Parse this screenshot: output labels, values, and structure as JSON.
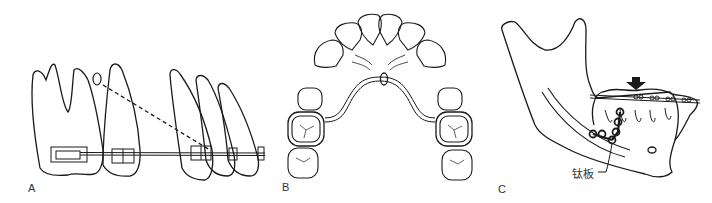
{
  "figure": {
    "panels": [
      {
        "id": "A",
        "label": "A",
        "description": "Lateral view of teeth with brackets, archwire and dashed ligature to a mini-implant/anchor"
      },
      {
        "id": "B",
        "label": "B",
        "description": "Occlusal view of maxillary arch with transpalatal arch connecting molar bands and central loop"
      },
      {
        "id": "C",
        "label": "C",
        "description": "Mandible lateral view with fixed appliance, intrusion arrow and titanium miniplate",
        "annotations": [
          {
            "text": "钛板",
            "meaning": "titanium plate"
          }
        ]
      }
    ],
    "colors": {
      "line": "#1a1a1a",
      "background": "#ffffff",
      "label": "#333333"
    }
  }
}
